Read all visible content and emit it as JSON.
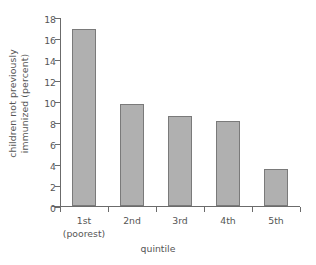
{
  "chart_data": {
    "type": "bar",
    "title": "",
    "subtitle": "",
    "xlabel": "quintile",
    "ylabel": "children not previously immunized (percent)",
    "ylabel_line1": "children not previously",
    "ylabel_line2": "immunized (percent)",
    "categories": [
      "1st",
      "2nd",
      "3rd",
      "4th",
      "5th"
    ],
    "category_sublabels": [
      "(poorest)",
      "",
      "",
      "",
      ""
    ],
    "values": [
      16.9,
      9.7,
      8.6,
      8.05,
      3.5
    ],
    "ylim": [
      0,
      18
    ],
    "ytick_values": [
      0,
      2,
      4,
      6,
      8,
      10,
      12,
      14,
      16,
      18
    ],
    "ytick_labels": [
      "0",
      "2",
      "4",
      "6",
      "8",
      "10",
      "12",
      "14",
      "16",
      "18"
    ],
    "grid": false,
    "legend": false,
    "legend_position": "none",
    "bar_fill_color": "#b0b0b0",
    "bar_edge_color": "#7a7a7a",
    "axis_color": "#6b6b6b",
    "text_color": "#555555",
    "background_color": "#ffffff"
  }
}
